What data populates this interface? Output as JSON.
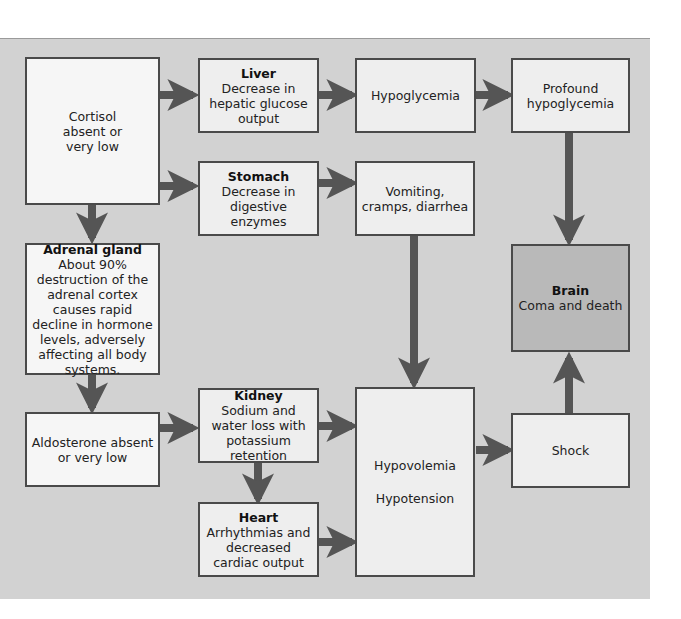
{
  "colors": {
    "background": "#d2d2d2",
    "box_fill": "#eeeeee",
    "box_border": "#4a4a4a",
    "arrow": "#555555",
    "brain_fill": "#b9b9b9"
  },
  "boxes": {
    "cortisol": {
      "text": "Cortisol absent or very low"
    },
    "liver": {
      "title": "Liver",
      "text": "Decrease in hepatic glucose output"
    },
    "hypoglycemia": {
      "text": "Hypoglycemia"
    },
    "profound": {
      "text": "Profound hypoglycemia"
    },
    "stomach": {
      "title": "Stomach",
      "text": "Decrease in digestive enzymes"
    },
    "vomiting": {
      "text": "Vomiting, cramps, diarrhea"
    },
    "adrenal": {
      "title": "Adrenal gland",
      "text": "About 90% destruction of the adrenal cortex causes rapid decline in hormone levels, adversely affecting all body systems."
    },
    "brain": {
      "title": "Brain",
      "text": "Coma and death"
    },
    "aldosterone": {
      "text": "Aldosterone absent or very low"
    },
    "kidney": {
      "title": "Kidney",
      "text": "Sodium and water loss with potassium retention"
    },
    "hypo": {
      "line1": "Hypovolemia",
      "line2": "Hypotension"
    },
    "shock": {
      "text": "Shock"
    },
    "heart": {
      "title": "Heart",
      "text": "Arrhythmias and decreased cardiac output"
    }
  },
  "edges": [
    [
      "Cortisol absent or very low",
      "Liver"
    ],
    [
      "Cortisol absent or very low",
      "Stomach"
    ],
    [
      "Cortisol absent or very low",
      "Adrenal gland"
    ],
    [
      "Liver",
      "Hypoglycemia"
    ],
    [
      "Hypoglycemia",
      "Profound hypoglycemia"
    ],
    [
      "Profound hypoglycemia",
      "Brain"
    ],
    [
      "Stomach",
      "Vomiting, cramps, diarrhea"
    ],
    [
      "Vomiting, cramps, diarrhea",
      "Hypovolemia / Hypotension"
    ],
    [
      "Adrenal gland",
      "Aldosterone absent or very low"
    ],
    [
      "Aldosterone absent or very low",
      "Kidney"
    ],
    [
      "Kidney",
      "Hypovolemia / Hypotension"
    ],
    [
      "Kidney",
      "Heart"
    ],
    [
      "Heart",
      "Hypovolemia / Hypotension"
    ],
    [
      "Hypovolemia / Hypotension",
      "Shock"
    ],
    [
      "Shock",
      "Brain"
    ]
  ]
}
